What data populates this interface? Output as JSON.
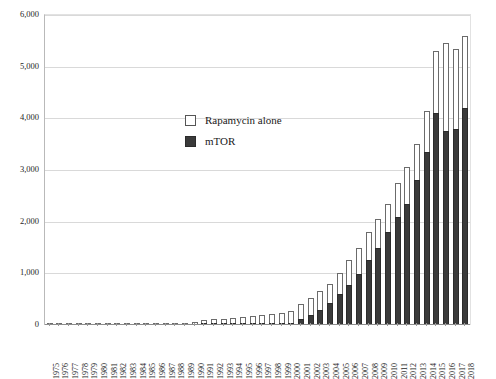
{
  "chart_data": {
    "type": "bar",
    "title": "",
    "subtitle": "",
    "xlabel": "",
    "ylabel": "",
    "ylim": [
      0,
      6000
    ],
    "yticks": [
      0,
      1000,
      2000,
      3000,
      4000,
      5000,
      6000
    ],
    "ytick_labels": [
      "0",
      "1,000",
      "2,000",
      "3,000",
      "4,000",
      "5,000",
      "6,000"
    ],
    "grid": true,
    "legend_position": "inside-upper-left",
    "stacking": "overlaid",
    "categories": [
      "1975",
      "1976",
      "1977",
      "1978",
      "1979",
      "1980",
      "1981",
      "1982",
      "1983",
      "1984",
      "1985",
      "1986",
      "1987",
      "1988",
      "1989",
      "1990",
      "1991",
      "1992",
      "1993",
      "1994",
      "1995",
      "1996",
      "1997",
      "1998",
      "1999",
      "2000",
      "2001",
      "2002",
      "2003",
      "2004",
      "2005",
      "2006",
      "2007",
      "2008",
      "2009",
      "2010",
      "2011",
      "2012",
      "2013",
      "2014",
      "2015",
      "2016",
      "2017",
      "2018"
    ],
    "series": [
      {
        "name": "Rapamycin alone",
        "color": "#ffffff",
        "edge_color": "#6b6b6b",
        "values": [
          6,
          5,
          7,
          8,
          10,
          12,
          14,
          13,
          16,
          18,
          20,
          22,
          26,
          30,
          40,
          55,
          95,
          110,
          120,
          135,
          150,
          165,
          190,
          215,
          240,
          280,
          400,
          520,
          650,
          800,
          1000,
          1250,
          1500,
          1800,
          2050,
          2350,
          2750,
          3050,
          3500,
          4150,
          5300,
          5450,
          5350,
          5600
        ]
      },
      {
        "name": "mTOR",
        "color": "#3a3a3a",
        "edge_color": "#2b2b2b",
        "values": [
          0,
          0,
          0,
          0,
          0,
          0,
          0,
          0,
          0,
          0,
          0,
          0,
          0,
          0,
          0,
          0,
          10,
          12,
          14,
          16,
          18,
          20,
          24,
          28,
          32,
          45,
          120,
          200,
          300,
          420,
          600,
          780,
          980,
          1250,
          1500,
          1800,
          2100,
          2350,
          2800,
          3350,
          4100,
          3750,
          3800,
          4200
        ]
      }
    ]
  },
  "legend": {
    "items": [
      {
        "label": "Rapamycin alone",
        "style": "open"
      },
      {
        "label": "mTOR",
        "style": "filled"
      }
    ]
  }
}
